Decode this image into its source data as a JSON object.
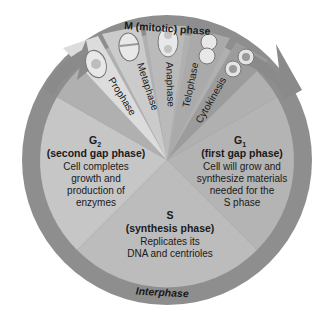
{
  "diagram": {
    "title": "M (mitotic) phase",
    "ring_label": "Interphase",
    "mitotic_stages": [
      {
        "label": "Prophase"
      },
      {
        "label": "Metaphase"
      },
      {
        "label": "Anaphase"
      },
      {
        "label": "Telophase"
      },
      {
        "label": "Cytokinesis"
      }
    ],
    "phases": {
      "g2": {
        "name": "G",
        "subscript": "2",
        "subtitle": "(second gap phase)",
        "lines": [
          "Cell completes",
          "growth and",
          "production of",
          "enzymes"
        ]
      },
      "g1": {
        "name": "G",
        "subscript": "1",
        "subtitle": "(first gap phase)",
        "lines": [
          "Cell will grow and",
          "synthesize materials",
          "needed for the",
          "S phase"
        ]
      },
      "s": {
        "name": "S",
        "subtitle": "(synthesis phase)",
        "lines": [
          "Replicates its",
          "DNA and centrioles"
        ]
      }
    },
    "colors": {
      "ring": "#8e8e8e",
      "arrow": "#8a8a8a",
      "g2": "#c6c6c6",
      "g1": "#b4b4b4",
      "s": "#bcbcbc",
      "wedge_prophase": "#dcdcdc",
      "wedge_metaphase": "#c9c9c9",
      "wedge_anaphase": "#b9b9b9",
      "wedge_telophase": "#a9a9a9",
      "wedge_cytokinesis": "#9c9c9c",
      "text": "#1a1a1a"
    }
  }
}
